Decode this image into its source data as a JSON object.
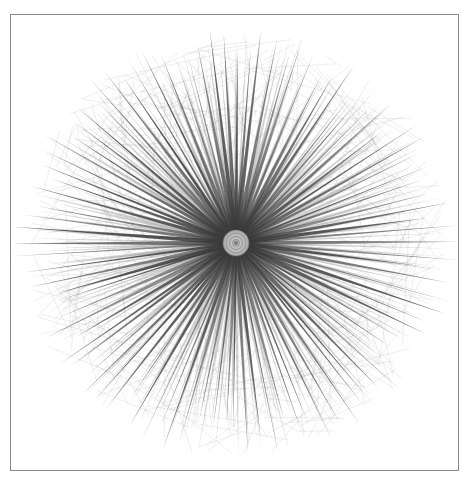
{
  "diagram": {
    "kind": "radial network graph",
    "title": "",
    "edge_color": "#3a3a3a",
    "faint_edge_color": "#9a9a9a",
    "hub_color": "#8a8a8a",
    "frame_color": "#8a8a8a",
    "spokes": {
      "primary_count": 96,
      "secondary_count": 160,
      "chord_count": 420
    },
    "hub": {
      "rings": 3
    }
  }
}
